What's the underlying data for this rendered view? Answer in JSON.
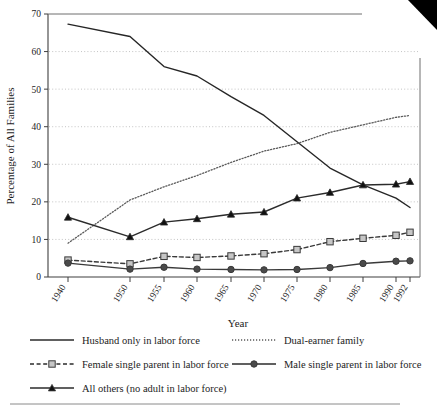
{
  "chart_data": {
    "type": "line",
    "title": "",
    "xlabel": "Year",
    "ylabel": "Percentage of All Families",
    "categories": [
      "1940",
      "1950",
      "1955",
      "1960",
      "1965",
      "1970",
      "1975",
      "1980",
      "1985",
      "1990",
      "1992"
    ],
    "x": [
      1940,
      1950,
      1955,
      1960,
      1965,
      1970,
      1975,
      1980,
      1985,
      1990,
      1992
    ],
    "ylim": [
      0,
      70
    ],
    "yticks": [
      0,
      10,
      20,
      30,
      40,
      50,
      60,
      70
    ],
    "ytick_labels": [
      "0",
      "10",
      "20",
      "30",
      "40",
      "50",
      "60",
      "70"
    ],
    "grid": "horizontal-dotted",
    "legend_position": "below-axes",
    "series": [
      {
        "name": "Husband only in labor force",
        "values": [
          67.3,
          64.0,
          56.0,
          53.5,
          48.0,
          43.0,
          36.0,
          29.0,
          24.5,
          21.0,
          18.5
        ],
        "style": "solid",
        "marker": "none",
        "color": "#262626"
      },
      {
        "name": "Dual-earner family",
        "values": [
          9.0,
          20.5,
          24.0,
          27.0,
          30.5,
          33.5,
          35.5,
          38.5,
          40.5,
          42.5,
          43.0
        ],
        "style": "dotted",
        "marker": "none",
        "color": "#5a5a5a"
      },
      {
        "name": "Female single parent in labor force",
        "values": [
          4.5,
          3.5,
          5.5,
          5.2,
          5.6,
          6.2,
          7.3,
          9.4,
          10.3,
          11.1,
          11.9
        ],
        "style": "dashed",
        "marker": "square",
        "color": "#3a3a3a",
        "marker_fill": "#c6c6c6"
      },
      {
        "name": "Male single parent in labor force",
        "values": [
          3.7,
          2.1,
          2.6,
          2.1,
          2.0,
          1.9,
          2.0,
          2.5,
          3.6,
          4.2,
          4.3
        ],
        "style": "solid",
        "marker": "circle",
        "color": "#3a3a3a",
        "marker_fill": "#4a4a4a"
      },
      {
        "name": "All others (no adult in labor force)",
        "values": [
          15.9,
          10.7,
          14.6,
          15.5,
          16.7,
          17.3,
          21.0,
          22.5,
          24.5,
          24.7,
          25.4
        ],
        "style": "solid",
        "marker": "triangle",
        "color": "#2b2b2b",
        "marker_fill": "#111111"
      }
    ]
  },
  "axes": {
    "ylabel": "Percentage of All Families",
    "xlabel": "Year"
  },
  "legend": {
    "entries": [
      {
        "label": "Husband only in labor force",
        "style": "solid",
        "marker": "none"
      },
      {
        "label": "Dual-earner family",
        "style": "dotted",
        "marker": "none"
      },
      {
        "label": "Female single parent in labor force",
        "style": "dashed",
        "marker": "square"
      },
      {
        "label": "Male single parent in labor force",
        "style": "solid",
        "marker": "circle"
      },
      {
        "label": "All others (no adult in labor force)",
        "style": "solid",
        "marker": "triangle"
      }
    ]
  },
  "footer": {
    "caption": ""
  },
  "colors": {
    "line_dark": "#262626",
    "line_mid": "#5a5a5a",
    "grid": "#bdbdbd",
    "frame": "#4a4a4a",
    "marker_gray": "#c6c6c6",
    "marker_dark": "#111111",
    "background": "#ffffff"
  }
}
